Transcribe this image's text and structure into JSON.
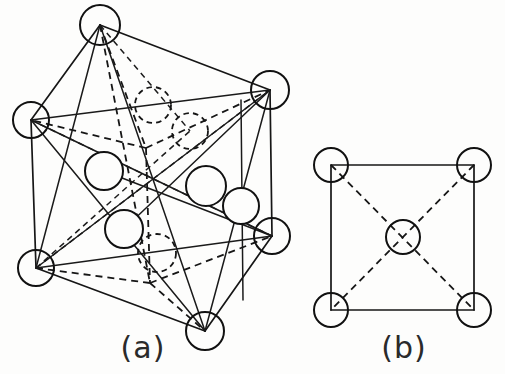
{
  "figure": {
    "background_color": "#fdfdfc",
    "line_color": "#161616",
    "width": 505,
    "height": 374
  },
  "panels": [
    {
      "id": "a",
      "label": "(a)",
      "label_x": 143,
      "label_y": 358,
      "description": "Three-dimensional perspective view of a face-centred tetragonal unit cell with corner atoms, face-centre atoms and dashed hidden edges",
      "view": "perspective-3d",
      "corner_atom_count": 6,
      "interior_atom_count": 7,
      "solid_edge_count": 14,
      "dashed_edge_count": 12
    },
    {
      "id": "b",
      "label": "(b)",
      "label_x": 404,
      "label_y": 358,
      "description": "Two-dimensional square projection with four corner atoms, one body-centre atom and dashed diagonals",
      "view": "plan-2d",
      "corner_atom_count": 4,
      "centre_atom_count": 1,
      "square_side_px": 143,
      "diagonal_count": 2
    }
  ],
  "panel_a_geometry": {
    "vertices": [
      {
        "name": "top",
        "x": 100,
        "y": 25,
        "r": 20,
        "style": "open"
      },
      {
        "name": "left",
        "x": 31,
        "y": 120,
        "r": 18,
        "style": "open"
      },
      {
        "name": "right-upper",
        "x": 270,
        "y": 90,
        "r": 19,
        "style": "open"
      },
      {
        "name": "bottom-left",
        "x": 36,
        "y": 268,
        "r": 18,
        "style": "open"
      },
      {
        "name": "bottom",
        "x": 205,
        "y": 331,
        "r": 19,
        "style": "open"
      },
      {
        "name": "right-lower",
        "x": 272,
        "y": 236,
        "r": 18,
        "style": "open"
      }
    ],
    "interior_atoms": [
      {
        "name": "face-upper-left",
        "x": 153,
        "y": 105,
        "r": 18,
        "style": "dashed"
      },
      {
        "name": "face-upper-right",
        "x": 190,
        "y": 131,
        "r": 18,
        "style": "dashed"
      },
      {
        "name": "face-mid-left",
        "x": 104,
        "y": 171,
        "r": 19,
        "style": "solid"
      },
      {
        "name": "face-mid-right",
        "x": 206,
        "y": 186,
        "r": 20,
        "style": "solid"
      },
      {
        "name": "face-right-edge",
        "x": 241,
        "y": 206,
        "r": 18,
        "style": "solid"
      },
      {
        "name": "face-lower-left",
        "x": 124,
        "y": 229,
        "r": 19,
        "style": "solid"
      },
      {
        "name": "face-lower-right",
        "x": 157,
        "y": 253,
        "r": 19,
        "style": "dashed"
      }
    ],
    "solid_edges": [
      [
        "top",
        "left"
      ],
      [
        "top",
        "right-upper"
      ],
      [
        "left",
        "bottom-left"
      ],
      [
        "right-upper",
        "right-lower"
      ],
      [
        "bottom-left",
        "bottom"
      ],
      [
        "bottom",
        "right-lower"
      ],
      [
        "left",
        "right-lower"
      ],
      [
        "top",
        "bottom"
      ],
      [
        "left",
        "right-upper"
      ],
      [
        "bottom-left",
        "right-lower"
      ],
      [
        "top",
        "bottom-left"
      ],
      [
        "right-upper",
        "bottom"
      ],
      [
        "left",
        "bottom"
      ],
      [
        "bottom-left",
        "right-upper"
      ]
    ],
    "dashed_edges": [
      [
        "top",
        "rear"
      ],
      [
        "rear",
        "left"
      ],
      [
        "rear",
        "right-upper"
      ],
      [
        "rear-lower",
        "bottom-left"
      ],
      [
        "rear-lower",
        "bottom"
      ],
      [
        "rear",
        "rear-lower"
      ],
      [
        "top",
        "rear-lower"
      ],
      [
        "left",
        "rear-right"
      ],
      [
        "rear-right",
        "right-lower"
      ]
    ],
    "hidden_vertices": [
      {
        "name": "rear",
        "x": 146,
        "y": 148
      },
      {
        "name": "rear-lower",
        "x": 150,
        "y": 283
      },
      {
        "name": "rear-right",
        "x": 268,
        "y": 237
      }
    ]
  },
  "panel_b_geometry": {
    "square": {
      "left": 331,
      "top": 165,
      "right": 474,
      "bottom": 310
    },
    "corner_atoms": [
      {
        "name": "top-left",
        "x": 331,
        "y": 165,
        "r": 17,
        "style": "open"
      },
      {
        "name": "top-right",
        "x": 474,
        "y": 165,
        "r": 17,
        "style": "open"
      },
      {
        "name": "bottom-left",
        "x": 331,
        "y": 310,
        "r": 17,
        "style": "open"
      },
      {
        "name": "bottom-right",
        "x": 474,
        "y": 310,
        "r": 17,
        "style": "open"
      }
    ],
    "centre_atom": {
      "name": "body-centre",
      "x": 403,
      "y": 237,
      "r": 17,
      "style": "open"
    },
    "diagonals": [
      [
        "top-left",
        "bottom-right"
      ],
      [
        "top-right",
        "bottom-left"
      ]
    ]
  }
}
